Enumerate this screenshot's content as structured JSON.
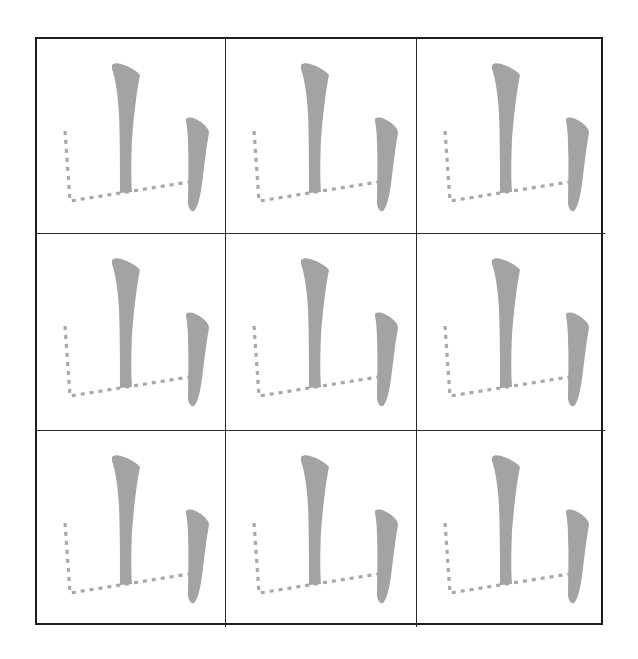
{
  "worksheet": {
    "character": "山",
    "grid": {
      "rows": 3,
      "columns": 3
    },
    "colors": {
      "grid_line": "#1e1e1e",
      "stroke_fill": "#a3a3a3",
      "dotted_guide": "#a8a8a8",
      "background": "#ffffff"
    },
    "cells": [
      {
        "label": "山",
        "solid_strokes": [
          "vertical-center",
          "vertical-right"
        ],
        "dotted_strokes": [
          "vertical-turn-left"
        ]
      },
      {
        "label": "山",
        "solid_strokes": [
          "vertical-center",
          "vertical-right"
        ],
        "dotted_strokes": [
          "vertical-turn-left"
        ]
      },
      {
        "label": "山",
        "solid_strokes": [
          "vertical-center",
          "vertical-right"
        ],
        "dotted_strokes": [
          "vertical-turn-left"
        ]
      },
      {
        "label": "山",
        "solid_strokes": [
          "vertical-center",
          "vertical-right"
        ],
        "dotted_strokes": [
          "vertical-turn-left"
        ]
      },
      {
        "label": "山",
        "solid_strokes": [
          "vertical-center",
          "vertical-right"
        ],
        "dotted_strokes": [
          "vertical-turn-left"
        ]
      },
      {
        "label": "山",
        "solid_strokes": [
          "vertical-center",
          "vertical-right"
        ],
        "dotted_strokes": [
          "vertical-turn-left"
        ]
      },
      {
        "label": "山",
        "solid_strokes": [
          "vertical-center",
          "vertical-right"
        ],
        "dotted_strokes": [
          "vertical-turn-left"
        ]
      },
      {
        "label": "山",
        "solid_strokes": [
          "vertical-center",
          "vertical-right"
        ],
        "dotted_strokes": [
          "vertical-turn-left"
        ]
      },
      {
        "label": "山",
        "solid_strokes": [
          "vertical-center",
          "vertical-right"
        ],
        "dotted_strokes": [
          "vertical-turn-left"
        ]
      }
    ]
  }
}
